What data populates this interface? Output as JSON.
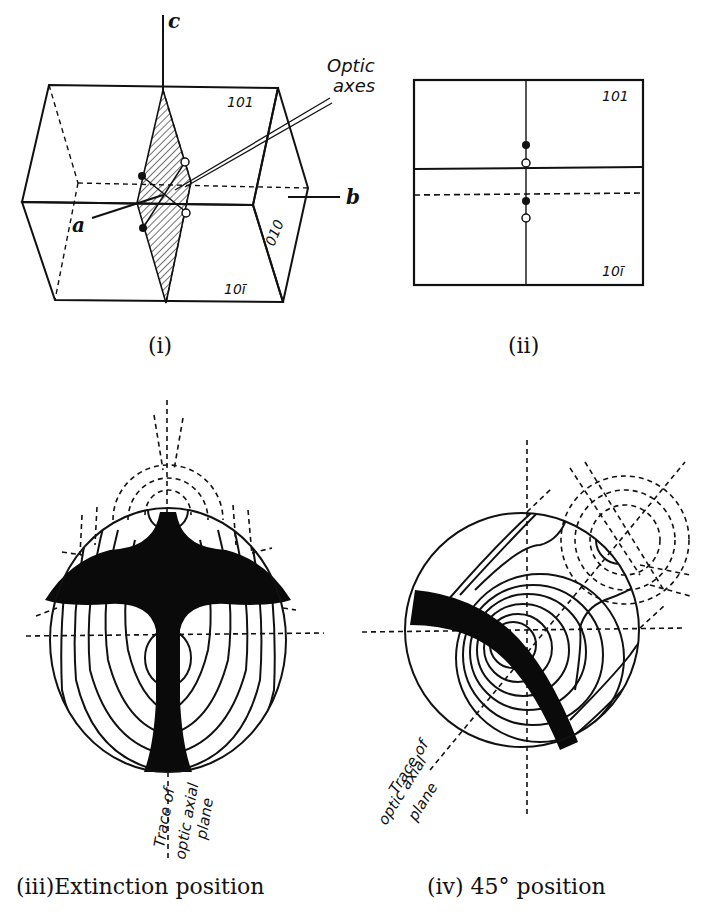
{
  "figure": {
    "panels": [
      {
        "id": "i",
        "caption": "(i)",
        "type": "crystal-block",
        "axes": {
          "a": "a",
          "b": "b",
          "c": "c"
        },
        "faces": [
          "101",
          "10ī",
          "010"
        ],
        "callout": {
          "line1": "Optic",
          "line2": "axes"
        }
      },
      {
        "id": "ii",
        "caption": "(ii)",
        "type": "face-projection",
        "faces": [
          "101",
          "10ī"
        ]
      },
      {
        "id": "iii",
        "caption": "(iii)Extinction position",
        "type": "interference-figure",
        "trace_label": {
          "line1": "Trace of",
          "line2": "optic axial",
          "line3": "plane"
        }
      },
      {
        "id": "iv",
        "caption": "(iv) 45° position",
        "type": "interference-figure",
        "trace_label": {
          "line1": "Trace of",
          "line2": "optic axial",
          "line3": "plane"
        }
      }
    ]
  }
}
